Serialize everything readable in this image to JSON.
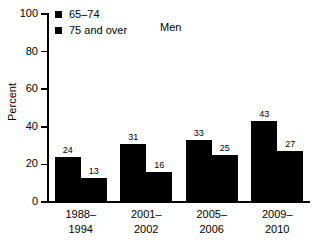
{
  "chart_data": {
    "type": "bar",
    "title": "Men",
    "xlabel": "",
    "ylabel": "Percent",
    "ylim": [
      0,
      100
    ],
    "yticks": [
      0,
      20,
      40,
      60,
      80,
      100
    ],
    "grid": false,
    "legend_position": "top-left",
    "categories": [
      "1988–1994",
      "2001–2002",
      "2005–2006",
      "2009–2010"
    ],
    "category_lines": [
      [
        "1988–",
        "1994"
      ],
      [
        "2001–",
        "2002"
      ],
      [
        "2005–",
        "2006"
      ],
      [
        "2009–",
        "2010"
      ]
    ],
    "series": [
      {
        "name": "65–74",
        "values": [
          24,
          31,
          33,
          43
        ],
        "color": "#000000"
      },
      {
        "name": "75 and over",
        "values": [
          13,
          16,
          25,
          27
        ],
        "color": "#000000"
      }
    ]
  },
  "axis": {
    "tick_labels": [
      "100",
      "80",
      "60",
      "40",
      "20",
      "0"
    ],
    "title": "Percent"
  },
  "legend": {
    "items": [
      {
        "label": "65–74"
      },
      {
        "label": "75 and over"
      }
    ],
    "series_title": "Men"
  },
  "colors": {
    "bar": "#000000",
    "axis": "#000000",
    "background": "#ffffff"
  }
}
